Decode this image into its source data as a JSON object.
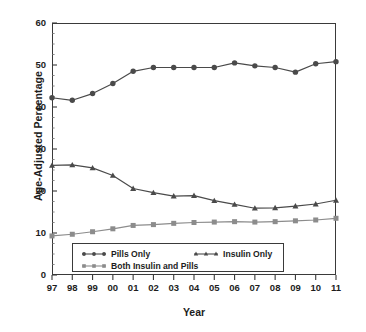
{
  "chart_data": {
    "type": "line",
    "title": "",
    "xlabel": "Year",
    "ylabel": "Age-Adjusted Percentage",
    "x": [
      "97",
      "98",
      "99",
      "00",
      "01",
      "02",
      "03",
      "04",
      "05",
      "06",
      "07",
      "08",
      "09",
      "10",
      "11"
    ],
    "xtick_labels": [
      "97",
      "98",
      "99",
      "00",
      "01",
      "02",
      "03",
      "04",
      "05",
      "06",
      "07",
      "08",
      "09",
      "10",
      "11"
    ],
    "ytick_labels": [
      "0",
      "10",
      "20",
      "30",
      "40",
      "50",
      "60"
    ],
    "ytick_values": [
      0,
      10,
      20,
      30,
      40,
      50,
      60
    ],
    "ylim": [
      0,
      60
    ],
    "xlim_index": [
      0,
      14
    ],
    "grid": false,
    "minor_ticks": true,
    "legend_position": "bottom-inside",
    "series": [
      {
        "name": "Pills Only",
        "marker": "circle",
        "color": "#4a4a4a",
        "values": [
          42.2,
          41.6,
          43.2,
          45.6,
          48.5,
          49.4,
          49.4,
          49.4,
          49.4,
          50.5,
          49.8,
          49.4,
          48.3,
          50.3,
          50.8
        ]
      },
      {
        "name": "Insulin Only",
        "marker": "triangle",
        "color": "#4a4a4a",
        "values": [
          26.1,
          26.2,
          25.5,
          23.7,
          20.6,
          19.6,
          18.8,
          18.9,
          17.7,
          16.8,
          15.9,
          16.0,
          16.4,
          16.9,
          17.8
        ]
      },
      {
        "name": "Both Insulin and Pills",
        "marker": "square",
        "color": "#8c8c8c",
        "values": [
          9.3,
          9.7,
          10.3,
          11.0,
          11.8,
          12.0,
          12.3,
          12.5,
          12.6,
          12.7,
          12.6,
          12.7,
          12.9,
          13.1,
          13.5
        ]
      }
    ]
  },
  "axes": {
    "ylabel_text": "Age-Adjusted Percentage",
    "xlabel_text": "Year"
  },
  "legend": {
    "items": [
      {
        "label": "Pills Only",
        "marker": "circle-marker",
        "color": "#4a4a4a"
      },
      {
        "label": "Insulin Only",
        "marker": "triangle-marker",
        "color": "#4a4a4a"
      },
      {
        "label": "Both Insulin and Pills",
        "marker": "square-marker",
        "color": "#8c8c8c"
      }
    ]
  }
}
